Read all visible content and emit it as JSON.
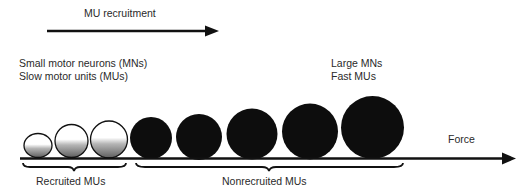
{
  "diagram": {
    "top_arrow": {
      "label": "MU recruitment"
    },
    "left_annotation": {
      "line1": "Small motor neurons (MNs)",
      "line2": "Slow motor units (MUs)"
    },
    "right_annotation": {
      "line1": "Large MNs",
      "line2": "Fast MUs"
    },
    "axis_arrow": {
      "label": "Force"
    },
    "groups": [
      {
        "label": "Recruited MUs",
        "count": 3,
        "style": "white-to-gray gradient"
      },
      {
        "label": "Nonrecruited MUs",
        "count": 5,
        "style": "solid black"
      }
    ],
    "motor_units": [
      {
        "index": 1,
        "state": "recruited",
        "size": "smallest"
      },
      {
        "index": 2,
        "state": "recruited",
        "size": "small"
      },
      {
        "index": 3,
        "state": "recruited",
        "size": "small"
      },
      {
        "index": 4,
        "state": "nonrecruited",
        "size": "medium"
      },
      {
        "index": 5,
        "state": "nonrecruited",
        "size": "medium"
      },
      {
        "index": 6,
        "state": "nonrecruited",
        "size": "large"
      },
      {
        "index": 7,
        "state": "nonrecruited",
        "size": "large"
      },
      {
        "index": 8,
        "state": "nonrecruited",
        "size": "largest"
      }
    ],
    "colors": {
      "ink": "#111111",
      "text": "#2a2a2a",
      "recruited_top": "#ffffff",
      "recruited_bottom": "#6e6e6e"
    }
  }
}
